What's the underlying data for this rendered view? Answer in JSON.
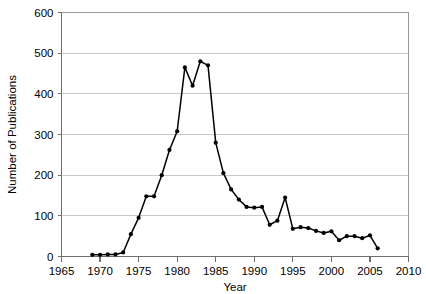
{
  "chart_data": {
    "type": "line",
    "title": "",
    "subtitle": "",
    "xlabel": "Year",
    "ylabel": "Number of Publications",
    "xlim": [
      1965,
      2010
    ],
    "ylim": [
      0,
      600
    ],
    "xticks": [
      1965,
      1970,
      1975,
      1980,
      1985,
      1990,
      1995,
      2000,
      2005,
      2010
    ],
    "yticks": [
      0,
      100,
      200,
      300,
      400,
      500,
      600
    ],
    "grid": "horizontal",
    "legend": "none",
    "marker": "filled-circle",
    "line_color": "#000000",
    "grid_color": "#c8c8c8",
    "axis_color": "#808080",
    "x": [
      1969,
      1970,
      1971,
      1972,
      1973,
      1974,
      1975,
      1976,
      1977,
      1978,
      1979,
      1980,
      1981,
      1982,
      1983,
      1984,
      1985,
      1986,
      1987,
      1988,
      1989,
      1990,
      1991,
      1992,
      1993,
      1994,
      1995,
      1996,
      1997,
      1998,
      1999,
      2000,
      2001,
      2002,
      2003,
      2004,
      2005,
      2006
    ],
    "values": [
      4,
      4,
      5,
      5,
      10,
      55,
      95,
      148,
      148,
      200,
      262,
      308,
      465,
      420,
      480,
      470,
      280,
      205,
      165,
      140,
      122,
      120,
      122,
      78,
      88,
      145,
      68,
      72,
      70,
      63,
      58,
      62,
      40,
      50,
      50,
      45,
      52,
      20
    ],
    "series": [
      {
        "name": "Number of Publications",
        "values": [
          4,
          4,
          5,
          5,
          10,
          55,
          95,
          148,
          148,
          200,
          262,
          308,
          465,
          420,
          480,
          470,
          280,
          205,
          165,
          140,
          122,
          120,
          122,
          78,
          88,
          145,
          68,
          72,
          70,
          63,
          58,
          62,
          40,
          50,
          50,
          45,
          52,
          20
        ]
      }
    ],
    "annotations": []
  }
}
